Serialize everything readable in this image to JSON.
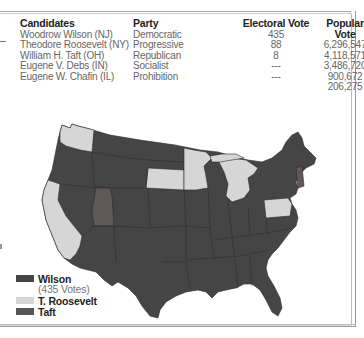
{
  "table": {
    "headers": {
      "candidates": "Candidates",
      "party": "Party",
      "electoral": "Electoral Vote",
      "popular": "Popular Vote"
    },
    "rows": [
      {
        "candidate": "Woodrow Wilson (NJ)",
        "party": "Democratic",
        "electoral": "435",
        "popular": "6,296,547"
      },
      {
        "candidate": "Theodore Roosevelt (NY)",
        "party": "Progressive",
        "electoral": "88",
        "popular": "4,118,571"
      },
      {
        "candidate": "William H. Taft (OH)",
        "party": "Republican",
        "electoral": "8",
        "popular": "3,486,720"
      },
      {
        "candidate": "Eugene V. Debs (IN)",
        "party": "Socialist",
        "electoral": "---",
        "popular": "900,672"
      },
      {
        "candidate": "Eugene W. Chafin (IL)",
        "party": "Prohibition",
        "electoral": "---",
        "popular": "206,275"
      }
    ]
  },
  "legend": {
    "items": [
      {
        "label": "Wilson",
        "sub": "(435 Votes)",
        "color": "#454545"
      },
      {
        "label": "T. Roosevelt",
        "color": "#d6d6d6"
      },
      {
        "label": "Taft",
        "color": "#5a5555"
      }
    ]
  },
  "map": {
    "colors": {
      "wilson": "#454545",
      "roosevelt": "#d6d6d6",
      "taft": "#5f5858",
      "border": "#2a2a2a"
    },
    "roosevelt_states": [
      "Washington",
      "California",
      "South Dakota",
      "Minnesota",
      "Michigan",
      "Pennsylvania"
    ],
    "taft_states": [
      "Utah",
      "Vermont"
    ]
  }
}
